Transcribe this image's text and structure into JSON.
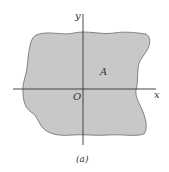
{
  "figure": {
    "caption": "(a)",
    "region_label": "A",
    "origin_label": "O",
    "x_axis_label": "x",
    "y_axis_label": "y",
    "colors": {
      "region_fill": "#c8c8c8",
      "region_stroke": "#6a6a6a",
      "axis": "#333333",
      "background": "#ffffff"
    }
  }
}
